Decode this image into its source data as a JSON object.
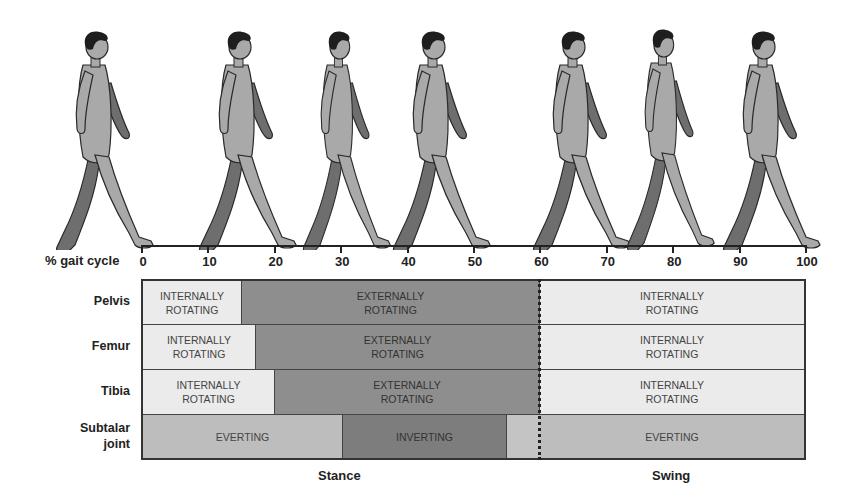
{
  "figure": {
    "title_axis": "% gait cycle",
    "walkers": [
      {
        "position_pct": 0,
        "x": 95
      },
      {
        "position_pct": 12,
        "x": 235
      },
      {
        "position_pct": 30,
        "x": 338
      },
      {
        "position_pct": 40,
        "x": 432
      },
      {
        "position_pct": 62,
        "x": 572
      },
      {
        "position_pct": 78,
        "x": 662
      },
      {
        "position_pct": 93,
        "x": 762
      }
    ],
    "colors": {
      "skin_light": "#a9a9a9",
      "skin_dark": "#6e6e6e",
      "hair": "#1e1e1e",
      "outline": "#2a2a2a"
    }
  },
  "axis": {
    "ticks": [
      "0",
      "10",
      "20",
      "30",
      "40",
      "50",
      "60",
      "70",
      "80",
      "90",
      "100"
    ]
  },
  "chart_data": {
    "type": "table",
    "xlabel": "% gait cycle",
    "x_range": [
      0,
      100
    ],
    "phases": [
      {
        "name": "Stance",
        "start": 0,
        "end": 60
      },
      {
        "name": "Swing",
        "start": 60,
        "end": 100
      }
    ],
    "rows": [
      {
        "label": "Pelvis",
        "segments": [
          {
            "start": 0,
            "end": 15,
            "text": "INTERNALLY ROTATING",
            "shade": "light"
          },
          {
            "start": 15,
            "end": 60,
            "text": "EXTERNALLY ROTATING",
            "shade": "dark"
          },
          {
            "start": 60,
            "end": 100,
            "text": "INTERNALLY ROTATING",
            "shade": "light"
          }
        ]
      },
      {
        "label": "Femur",
        "segments": [
          {
            "start": 0,
            "end": 17,
            "text": "INTERNALLY ROTATING",
            "shade": "light"
          },
          {
            "start": 17,
            "end": 60,
            "text": "EXTERNALLY ROTATING",
            "shade": "dark"
          },
          {
            "start": 60,
            "end": 100,
            "text": "INTERNALLY ROTATING",
            "shade": "light"
          }
        ]
      },
      {
        "label": "Tibia",
        "segments": [
          {
            "start": 0,
            "end": 20,
            "text": "INTERNALLY ROTATING",
            "shade": "light"
          },
          {
            "start": 20,
            "end": 60,
            "text": "EXTERNALLY ROTATING",
            "shade": "dark"
          },
          {
            "start": 60,
            "end": 100,
            "text": "INTERNALLY ROTATING",
            "shade": "light"
          }
        ]
      },
      {
        "label": "Subtalar joint",
        "segments": [
          {
            "start": 0,
            "end": 30,
            "text": "EVERTING",
            "shade": "mid"
          },
          {
            "start": 30,
            "end": 55,
            "text": "INVERTING",
            "shade": "darker"
          },
          {
            "start": 55,
            "end": 100,
            "text": "EVERTING",
            "shade": "mid"
          }
        ]
      }
    ],
    "divider_at": 60
  },
  "table": {
    "rows": [
      {
        "label_lines": [
          "Pelvis"
        ],
        "segs": [
          {
            "lines": [
              "INTERNALLY",
              "ROTATING"
            ]
          },
          {
            "lines": [
              "EXTERNALLY",
              "ROTATING"
            ]
          },
          {
            "lines": [
              "INTERNALLY",
              "ROTATING"
            ]
          }
        ]
      },
      {
        "label_lines": [
          "Femur"
        ],
        "segs": [
          {
            "lines": [
              "INTERNALLY",
              "ROTATING"
            ]
          },
          {
            "lines": [
              "EXTERNALLY",
              "ROTATING"
            ]
          },
          {
            "lines": [
              "INTERNALLY",
              "ROTATING"
            ]
          }
        ]
      },
      {
        "label_lines": [
          "Tibia"
        ],
        "segs": [
          {
            "lines": [
              "INTERNALLY",
              "ROTATING"
            ]
          },
          {
            "lines": [
              "EXTERNALLY",
              "ROTATING"
            ]
          },
          {
            "lines": [
              "INTERNALLY",
              "ROTATING"
            ]
          }
        ]
      },
      {
        "label_lines": [
          "Subtalar",
          "joint"
        ],
        "segs": [
          {
            "lines": [
              "EVERTING"
            ]
          },
          {
            "lines": [
              "INVERTING"
            ]
          },
          {
            "lines": [
              ""
            ]
          },
          {
            "lines": [
              "EVERTING"
            ]
          }
        ]
      }
    ]
  },
  "phases": {
    "stance": "Stance",
    "swing": "Swing"
  },
  "colors": {
    "light": "#ebebeb",
    "dark": "#8e8e8e",
    "mid": "#bdbdbd",
    "darker": "#7d7d7d",
    "border": "#333333"
  }
}
